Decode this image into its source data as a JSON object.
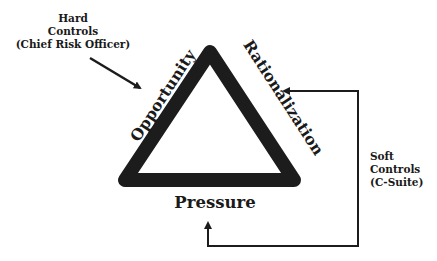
{
  "diagram": {
    "type": "fraud-triangle",
    "vertices_labels": {
      "left_side": "Opportunity",
      "right_side": "Rationalization",
      "bottom": "Pressure"
    },
    "hard_controls": {
      "line1": "Hard",
      "line2": "Controls",
      "line3": "(Chief Risk Officer)",
      "points_to": "Opportunity"
    },
    "soft_controls": {
      "line1": "Soft",
      "line2": "Controls",
      "line3": "(C-Suite)",
      "points_to": [
        "Rationalization",
        "Pressure"
      ]
    },
    "colors": {
      "stroke": "#1c1c1c",
      "text": "#1a1a1a",
      "background": "#ffffff"
    }
  }
}
